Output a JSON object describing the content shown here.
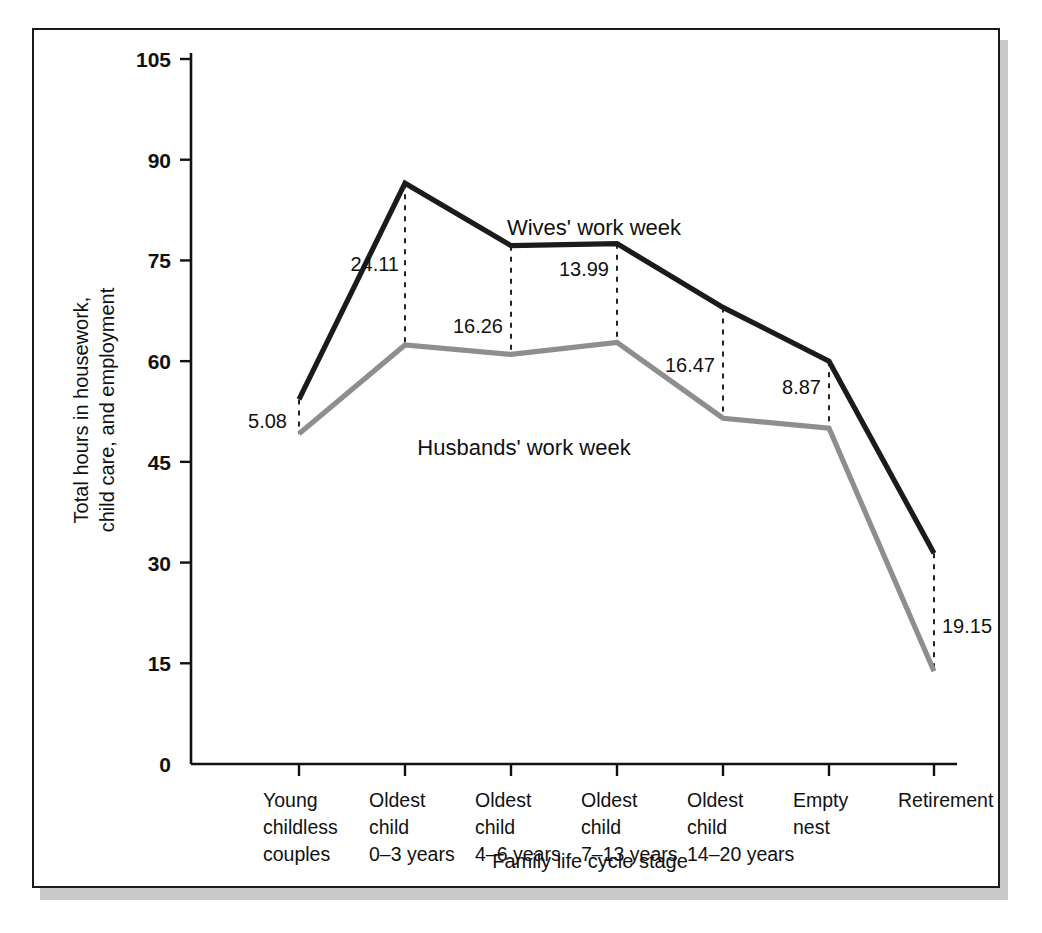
{
  "chart_data": {
    "type": "line",
    "title": "",
    "xlabel": "Family life cycle stage",
    "ylabel": "Total hours in housework,\nchild care, and employment",
    "ylabel_line1": "Total hours in housework,",
    "ylabel_line2": "child care, and employment",
    "ylim": [
      0,
      105
    ],
    "yticks": [
      0,
      15,
      30,
      45,
      60,
      75,
      90,
      105
    ],
    "ytick_labels": [
      "0",
      "15",
      "30",
      "45",
      "60",
      "75",
      "90",
      "105"
    ],
    "grid": false,
    "legend_position": "inline-annotation",
    "categories": [
      "Young childless couples",
      "Oldest child 0–3 years",
      "Oldest child 4–6 years",
      "Oldest child 7–13 years",
      "Oldest child 14–20 years",
      "Empty nest",
      "Retirement"
    ],
    "category_label_lines": [
      [
        "Young",
        "childless",
        "couples"
      ],
      [
        "Oldest",
        "child",
        "0–3 years"
      ],
      [
        "Oldest",
        "child",
        "4–6 years"
      ],
      [
        "Oldest",
        "child",
        "7–13 years"
      ],
      [
        "Oldest",
        "child",
        "14–20 years"
      ],
      [
        "Empty",
        "nest"
      ],
      [
        "Retirement"
      ]
    ],
    "series": [
      {
        "name": "Wives' work week",
        "color": "#1b1b1b",
        "values": [
          54.3,
          86.5,
          77.2,
          77.5,
          68.0,
          60.0,
          31.4
        ]
      },
      {
        "name": "Husbands' work week",
        "color": "#8e8e8e",
        "values": [
          49.2,
          62.4,
          61.0,
          62.8,
          51.5,
          50.0,
          13.8
        ]
      }
    ],
    "gap_annotations": [
      {
        "category_index": 0,
        "value": "5.08"
      },
      {
        "category_index": 1,
        "value": "24.11"
      },
      {
        "category_index": 2,
        "value": "16.26"
      },
      {
        "category_index": 3,
        "value": "13.99"
      },
      {
        "category_index": 4,
        "value": "16.47"
      },
      {
        "category_index": 5,
        "value": "8.87"
      },
      {
        "category_index": 6,
        "value": "19.15"
      }
    ],
    "series_labels": [
      {
        "text": "Wives' work week",
        "x": 560,
        "y": 205
      },
      {
        "text": "Husbands' work week",
        "x": 490,
        "y": 425
      }
    ]
  },
  "colors": {
    "wives_line": "#1b1b1b",
    "husbands_line": "#8e8e8e",
    "axis": "#111111",
    "frame": "#1b1b1b",
    "shadow": "#c9c9c9",
    "background": "#ffffff"
  }
}
